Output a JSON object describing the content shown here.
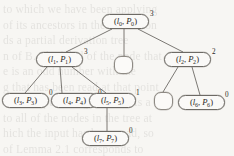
{
  "figure": {
    "kind": "tree-diagram",
    "width": 234,
    "height": 156,
    "background_color": "#f7f6f3",
    "line_color": "#6d6a65",
    "text_color": "#2b2926"
  },
  "bleed_text": {
    "lines": [
      "to which we have been applying",
      "of its ancestors in the derivation",
      "ds    a partial derivation tree",
      "n of  B. The label of the node that",
      "e is an odd number with the",
      "g that has been read at that point",
      "of the input string is read. As a",
      "to all of the nodes in the tree at",
      "hich the input has been read, so",
      "of Lemma 2.1 corresponds to"
    ]
  },
  "nodes": [
    {
      "id": "n0",
      "label": "(l0, P0)",
      "l_sub": "0",
      "p_sub": "0",
      "superscript": "3",
      "empty": false,
      "x": 102,
      "y": 14,
      "w": 47,
      "h": 15,
      "sup_x": 150,
      "sup_y": 11
    },
    {
      "id": "n1",
      "label": "(l1, P1)",
      "l_sub": "1",
      "p_sub": "1",
      "superscript": "3",
      "empty": false,
      "x": 36,
      "y": 52,
      "w": 47,
      "h": 15,
      "sup_x": 84,
      "sup_y": 49
    },
    {
      "id": "nE1",
      "label": "",
      "l_sub": "",
      "p_sub": "",
      "superscript": "",
      "empty": true,
      "x": 114,
      "y": 56,
      "w": 19,
      "h": 18,
      "sup_x": 0,
      "sup_y": 0
    },
    {
      "id": "n2",
      "label": "(l2, P2)",
      "l_sub": "2",
      "p_sub": "2",
      "superscript": "2",
      "empty": false,
      "x": 164,
      "y": 52,
      "w": 47,
      "h": 15,
      "sup_x": 212,
      "sup_y": 49
    },
    {
      "id": "n3",
      "label": "(l3, P3)",
      "l_sub": "3",
      "p_sub": "3",
      "superscript": "0",
      "empty": false,
      "x": 2,
      "y": 93,
      "w": 47,
      "h": 15,
      "sup_x": 49,
      "sup_y": 90
    },
    {
      "id": "n4",
      "label": "(l4, P4)",
      "l_sub": "4",
      "p_sub": "4",
      "superscript": "0",
      "empty": false,
      "x": 51,
      "y": 93,
      "w": 47,
      "h": 15,
      "sup_x": 98,
      "sup_y": 90
    },
    {
      "id": "n5",
      "label": "(l5, P5)",
      "l_sub": "5",
      "p_sub": "5",
      "superscript": "1",
      "empty": false,
      "x": 89,
      "y": 93,
      "w": 47,
      "h": 15,
      "sup_x": 136,
      "sup_y": 90
    },
    {
      "id": "nE2",
      "label": "",
      "l_sub": "",
      "p_sub": "",
      "superscript": "",
      "empty": true,
      "x": 154,
      "y": 92,
      "w": 19,
      "h": 18,
      "sup_x": 0,
      "sup_y": 0
    },
    {
      "id": "n6",
      "label": "(l6, P6)",
      "l_sub": "6",
      "p_sub": "6",
      "superscript": "0",
      "empty": false,
      "x": 178,
      "y": 95,
      "w": 47,
      "h": 15,
      "sup_x": 225,
      "sup_y": 92
    },
    {
      "id": "n7",
      "label": "(l7, P7)",
      "l_sub": "7",
      "p_sub": "7",
      "superscript": "0",
      "empty": false,
      "x": 82,
      "y": 131,
      "w": 47,
      "h": 15,
      "sup_x": 129,
      "sup_y": 128
    }
  ],
  "edges": [
    {
      "from": "n0",
      "to": "n1",
      "x1": 112,
      "y1": 29,
      "x2": 66,
      "y2": 52
    },
    {
      "from": "n0",
      "to": "nE1",
      "x1": 124,
      "y1": 29,
      "x2": 124,
      "y2": 56
    },
    {
      "from": "n0",
      "to": "n2",
      "x1": 138,
      "y1": 29,
      "x2": 183,
      "y2": 52
    },
    {
      "from": "n1",
      "to": "n3",
      "x1": 47,
      "y1": 67,
      "x2": 25,
      "y2": 93
    },
    {
      "from": "n1",
      "to": "n4",
      "x1": 60,
      "y1": 67,
      "x2": 62,
      "y2": 93
    },
    {
      "from": "n1",
      "to": "n5",
      "x1": 72,
      "y1": 67,
      "x2": 106,
      "y2": 93
    },
    {
      "from": "n2",
      "to": "nE2",
      "x1": 178,
      "y1": 67,
      "x2": 163,
      "y2": 92
    },
    {
      "from": "n2",
      "to": "n6",
      "x1": 192,
      "y1": 67,
      "x2": 200,
      "y2": 95
    },
    {
      "from": "n5",
      "to": "n7",
      "x1": 107,
      "y1": 108,
      "x2": 107,
      "y2": 131
    }
  ]
}
